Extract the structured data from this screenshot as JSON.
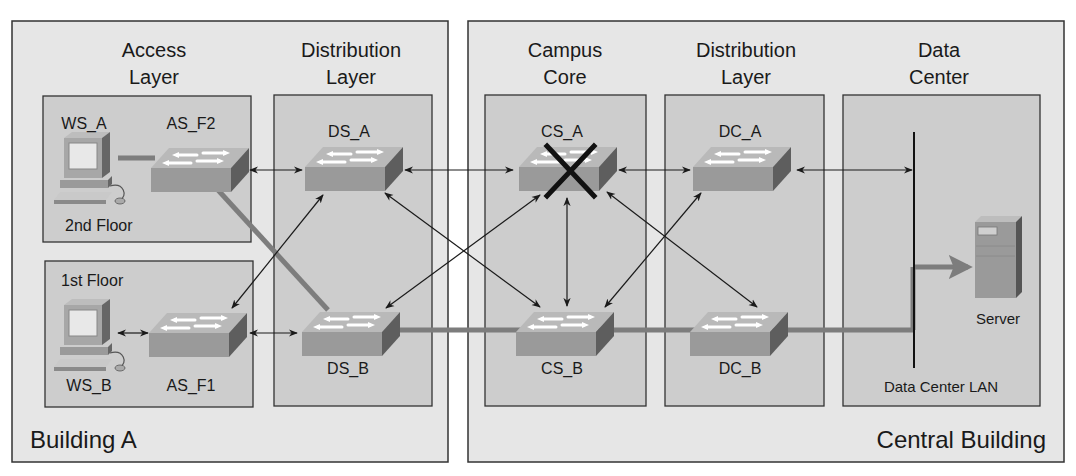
{
  "buildings": {
    "building_a": {
      "label": "Building A"
    },
    "central": {
      "label": "Central Building"
    }
  },
  "layers": {
    "access": {
      "line1": "Access",
      "line2": "Layer"
    },
    "distribution_a": {
      "line1": "Distribution",
      "line2": "Layer"
    },
    "campus_core": {
      "line1": "Campus",
      "line2": "Core"
    },
    "distribution_c": {
      "line1": "Distribution",
      "line2": "Layer"
    },
    "data_center": {
      "line1": "Data",
      "line2": "Center"
    }
  },
  "floors": {
    "second": "2nd Floor",
    "first": "1st Floor"
  },
  "devices": {
    "ws_a": "WS_A",
    "ws_b": "WS_B",
    "as_f2": "AS_F2",
    "as_f1": "AS_F1",
    "ds_a": "DS_A",
    "ds_b": "DS_B",
    "cs_a": "CS_A",
    "cs_b": "CS_B",
    "dc_a": "DC_A",
    "dc_b": "DC_B",
    "server": "Server",
    "dc_lan": "Data Center LAN"
  },
  "status": {
    "failed_device": "CS_A",
    "highlight_path": [
      "WS_A",
      "AS_F2",
      "DS_B",
      "CS_B",
      "DC_B",
      "Data Center LAN",
      "Server"
    ]
  },
  "colors": {
    "outer_bg": "#e6e6e6",
    "inner_bg": "#cdcdcd",
    "border": "#333333",
    "path": "#7d7d7d",
    "switch_top": "#b9b9b9",
    "switch_front": "#9a9a9a",
    "switch_side": "#5e5e5e",
    "fail_x": "#111111"
  }
}
